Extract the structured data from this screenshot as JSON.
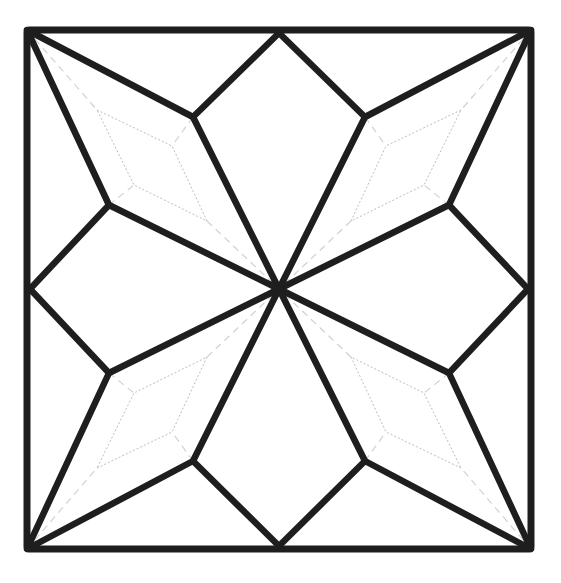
{
  "diagram": {
    "type": "quilt-block-eight-point-star",
    "colors": {
      "stroke": "#1e1e1e",
      "guide": "#bdbdbd",
      "background": "#ffffff"
    },
    "frame": {
      "x": 27,
      "y": 30,
      "width": 504,
      "height": 519
    },
    "center": [
      279,
      289
    ],
    "petals": [
      {
        "name": "top-left",
        "outer": [
          [
            27,
            30
          ],
          [
            193,
            117
          ],
          [
            279,
            289
          ],
          [
            109,
            205
          ]
        ],
        "inner": [
          [
            97,
            110
          ],
          [
            172,
            146
          ],
          [
            207,
            221
          ],
          [
            134,
            185
          ]
        ]
      },
      {
        "name": "top-right",
        "outer": [
          [
            531,
            30
          ],
          [
            365,
            117
          ],
          [
            279,
            289
          ],
          [
            449,
            205
          ]
        ],
        "inner": [
          [
            461,
            110
          ],
          [
            386,
            146
          ],
          [
            351,
            221
          ],
          [
            424,
            185
          ]
        ]
      },
      {
        "name": "bottom-left",
        "outer": [
          [
            27,
            549
          ],
          [
            193,
            461
          ],
          [
            279,
            289
          ],
          [
            109,
            373
          ]
        ],
        "inner": [
          [
            97,
            468
          ],
          [
            172,
            432
          ],
          [
            207,
            357
          ],
          [
            134,
            393
          ]
        ]
      },
      {
        "name": "bottom-right",
        "outer": [
          [
            531,
            549
          ],
          [
            365,
            461
          ],
          [
            279,
            289
          ],
          [
            449,
            373
          ]
        ],
        "inner": [
          [
            461,
            468
          ],
          [
            386,
            432
          ],
          [
            351,
            357
          ],
          [
            424,
            393
          ]
        ]
      }
    ],
    "edge_midpoints": {
      "top": [
        279,
        30
      ],
      "bottom": [
        279,
        549
      ],
      "left": [
        27,
        289
      ],
      "right": [
        531,
        289
      ]
    }
  }
}
